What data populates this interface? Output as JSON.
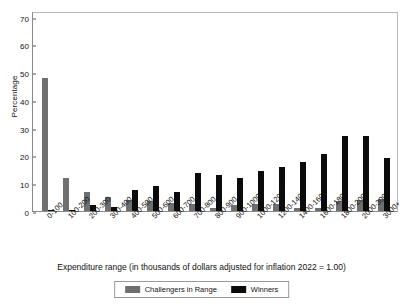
{
  "chart_data": {
    "type": "bar",
    "title": "",
    "xlabel": "Expenditure range (in thousands of dollars adjusted for inflation 2022 = 1.00)",
    "ylabel": "Percentage",
    "ylim": [
      0,
      72
    ],
    "yticks": [
      0,
      10,
      20,
      30,
      40,
      50,
      60,
      70
    ],
    "grid": false,
    "legend_position": "bottom",
    "categories": [
      "0-100",
      "100-200",
      "200-300",
      "300-400",
      "400-500",
      "500-600",
      "600-700",
      "700-800",
      "800-900",
      "900-1000",
      "1000-1200",
      "1200-1400",
      "1400-1600",
      "1600-1800",
      "1800-2000",
      "2000-3000",
      "3000+"
    ],
    "series": [
      {
        "name": "Challengers in Range",
        "color": "#6f6f6f",
        "values": [
          48,
          11.8,
          7,
          5,
          4,
          3.5,
          3,
          2.5,
          1,
          2,
          2.5,
          2.5,
          1,
          1,
          3.5,
          4,
          4.2
        ]
      },
      {
        "name": "Winners",
        "color": "#0c0a0a",
        "values": [
          0.3,
          0.2,
          2,
          1.5,
          7.7,
          9,
          7,
          13.8,
          13,
          11.8,
          14.5,
          16,
          17.5,
          20.5,
          27,
          27,
          19.2
        ]
      }
    ]
  },
  "axis": {
    "y_title": "Percentage",
    "x_title": "Expenditure range (in thousands of dollars adjusted for inflation 2022 = 1.00)"
  },
  "legend": {
    "items": [
      {
        "label": "Challengers in Range",
        "color": "#6f6f6f"
      },
      {
        "label": "Winners",
        "color": "#0c0a0a"
      }
    ]
  }
}
